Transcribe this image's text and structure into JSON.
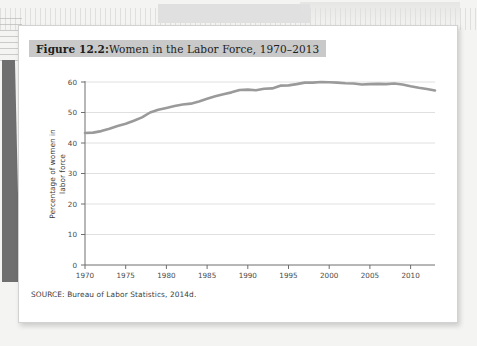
{
  "figure": {
    "title_prefix": "Figure 12.2:",
    "title_rest": " Women in the Labor Force, 1970–2013",
    "source": "SOURCE: Bureau of Labor Statistics, 2014d."
  },
  "colors": {
    "page": "#ffffff",
    "title_band": "#c9c9c9",
    "line": "#9a9a9a",
    "gridline": "#d8d8d8",
    "axis": "#6e6e6e",
    "text": "#3a3a3a",
    "desk": "#f4f4f2",
    "left_shadow": "#6f6f6f"
  },
  "chart_data": {
    "type": "line",
    "title": "Figure 12.2: Women in the Labor Force, 1970–2013",
    "xlabel": "",
    "ylabel": "Percentage of women in labor force",
    "xlim": [
      1970,
      2013
    ],
    "ylim": [
      0,
      60
    ],
    "xticks": [
      1970,
      1975,
      1980,
      1985,
      1990,
      1995,
      2000,
      2005,
      2010
    ],
    "yticks": [
      0,
      10,
      20,
      30,
      40,
      50,
      60
    ],
    "grid": "horizontal",
    "legend": "none",
    "source": "SOURCE: Bureau of Labor Statistics, 2014d.",
    "series": [
      {
        "name": "Percentage of women in labor force",
        "color": "#9a9a9a",
        "x": [
          1970,
          1971,
          1972,
          1973,
          1974,
          1975,
          1976,
          1977,
          1978,
          1979,
          1980,
          1981,
          1982,
          1983,
          1984,
          1985,
          1986,
          1987,
          1988,
          1989,
          1990,
          1991,
          1992,
          1993,
          1994,
          1995,
          1996,
          1997,
          1998,
          1999,
          2000,
          2001,
          2002,
          2003,
          2004,
          2005,
          2006,
          2007,
          2008,
          2009,
          2010,
          2011,
          2012,
          2013
        ],
        "values": [
          43.3,
          43.4,
          43.9,
          44.7,
          45.6,
          46.3,
          47.3,
          48.4,
          50.0,
          50.9,
          51.5,
          52.1,
          52.6,
          52.9,
          53.6,
          54.5,
          55.3,
          56.0,
          56.6,
          57.4,
          57.5,
          57.3,
          57.8,
          57.9,
          58.8,
          58.9,
          59.3,
          59.8,
          59.8,
          60.0,
          59.9,
          59.8,
          59.6,
          59.5,
          59.2,
          59.3,
          59.4,
          59.3,
          59.5,
          59.2,
          58.6,
          58.1,
          57.7,
          57.2
        ]
      }
    ]
  }
}
